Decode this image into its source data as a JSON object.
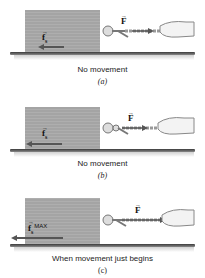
{
  "figure": {
    "panels": [
      {
        "id": "a",
        "caption": "No movement",
        "sublabel": "(a)",
        "applied_force_label": "F",
        "friction_label": "f",
        "friction_subscript": "s",
        "friction_suffix": "",
        "friction_arrow_length": "short",
        "applied_force_arrow_length": "short"
      },
      {
        "id": "b",
        "caption": "No movement",
        "sublabel": "(b)",
        "applied_force_label": "F",
        "friction_label": "f",
        "friction_subscript": "s",
        "friction_suffix": "",
        "friction_arrow_length": "medium",
        "applied_force_arrow_length": "medium"
      },
      {
        "id": "c",
        "caption": "When movement just begins",
        "sublabel": "(c)",
        "applied_force_label": "F",
        "friction_label": "f",
        "friction_subscript": "s",
        "friction_suffix": "MAX",
        "friction_arrow_length": "long",
        "applied_force_arrow_length": "long"
      }
    ],
    "colors": {
      "block": "#a9a9a9",
      "arrow": "#555555",
      "floor": "#3a3a3a",
      "text": "#222222"
    }
  }
}
